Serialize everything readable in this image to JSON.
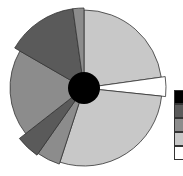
{
  "chart_data": {
    "type": "pie",
    "variant": "variable-radius pie with center hole",
    "title": "",
    "center": [
      84,
      88
    ],
    "hole_radius": 16,
    "hole_color": "#000000",
    "slices": [
      {
        "start_deg": 0,
        "end_deg": 82,
        "radius": 78,
        "color": "#c8c8c8"
      },
      {
        "start_deg": 82,
        "end_deg": 96,
        "radius": 82,
        "color": "#ffffff"
      },
      {
        "start_deg": 96,
        "end_deg": 198,
        "radius": 78,
        "color": "#c8c8c8"
      },
      {
        "start_deg": 198,
        "end_deg": 215,
        "radius": 80,
        "color": "#8c8c8c"
      },
      {
        "start_deg": 215,
        "end_deg": 232,
        "radius": 82,
        "color": "#5a5a5a"
      },
      {
        "start_deg": 232,
        "end_deg": 300,
        "radius": 74,
        "color": "#8c8c8c"
      },
      {
        "start_deg": 300,
        "end_deg": 352,
        "radius": 80,
        "color": "#5a5a5a"
      },
      {
        "start_deg": 352,
        "end_deg": 360,
        "radius": 80,
        "color": "#8c8c8c"
      }
    ],
    "legend": {
      "position": "right (clipped)",
      "swatches": [
        "#000000",
        "#5a5a5a",
        "#8c8c8c",
        "#c8c8c8",
        "#ffffff"
      ],
      "labels": []
    }
  }
}
